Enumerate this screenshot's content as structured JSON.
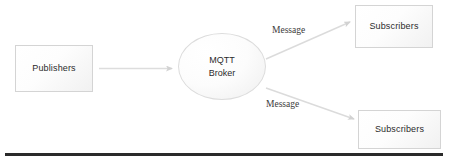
{
  "diagram": {
    "nodes": {
      "publishers": {
        "label": "Publishers",
        "shape": "rectangle"
      },
      "broker": {
        "label_line1": "MQTT",
        "label_line2": "Broker",
        "shape": "ellipse"
      },
      "subscribers_top": {
        "label": "Subscribers",
        "shape": "rectangle"
      },
      "subscribers_bottom": {
        "label": "Subscribers",
        "shape": "rectangle"
      }
    },
    "edges": [
      {
        "id": "publishers-to-broker",
        "label": "",
        "from": "publishers",
        "to": "broker",
        "arrow": true
      },
      {
        "id": "broker-to-subscribers-top",
        "label": "Message",
        "from": "broker",
        "to": "subscribers_top",
        "arrow": true
      },
      {
        "id": "broker-to-subscribers-bottom",
        "label": "Message",
        "from": "broker",
        "to": "subscribers_bottom",
        "arrow": true
      }
    ],
    "edge_labels": {
      "top": "Message",
      "bottom": "Message"
    },
    "colors": {
      "node_border": "#d4d4d4",
      "node_fill": "#fbfbfb",
      "text": "#2b2b2b",
      "connector": "#d8d8d8",
      "rule": "#2a2a2a",
      "background": "#ffffff"
    }
  }
}
